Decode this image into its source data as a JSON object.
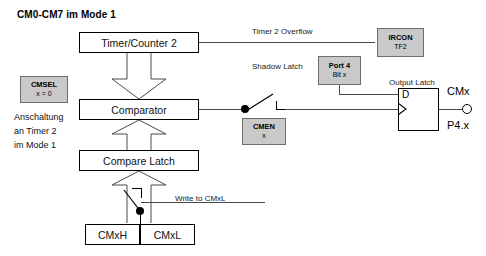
{
  "diagram": {
    "title": "CM0-CM7 im Mode 1",
    "blocks": {
      "timer_counter": "Timer/Counter 2",
      "comparator": "Comparator",
      "compare_latch": "Compare Latch",
      "cmxh": "CMxH",
      "cmxl": "CMxL"
    },
    "registers": {
      "cmsel": {
        "name": "CMSEL",
        "value": "x = 0"
      },
      "ircon": {
        "name": "IRCON",
        "value": "TF2"
      },
      "port4": {
        "name": "Port 4",
        "value": "Bit  x"
      },
      "cmen": {
        "name": "CMEN",
        "value": "x"
      }
    },
    "labels": {
      "timer2_overflow": "Timer 2 Overflow",
      "shadow_latch": "Shadow Latch",
      "output_latch": "Output Latch",
      "write_to_cmxl": "Write to CMxL",
      "d_input": "D",
      "cmx": "CMx",
      "p4x": "P4.x"
    },
    "side_note": {
      "line1": "Anschaltung",
      "line2": "an Timer 2",
      "line3": "im Mode 1"
    },
    "colors": {
      "register_fill": "#c9c9c9",
      "register_border": "#6d6d6d",
      "line": "#4a4a4a",
      "text": "#000000",
      "background": "#ffffff"
    }
  }
}
